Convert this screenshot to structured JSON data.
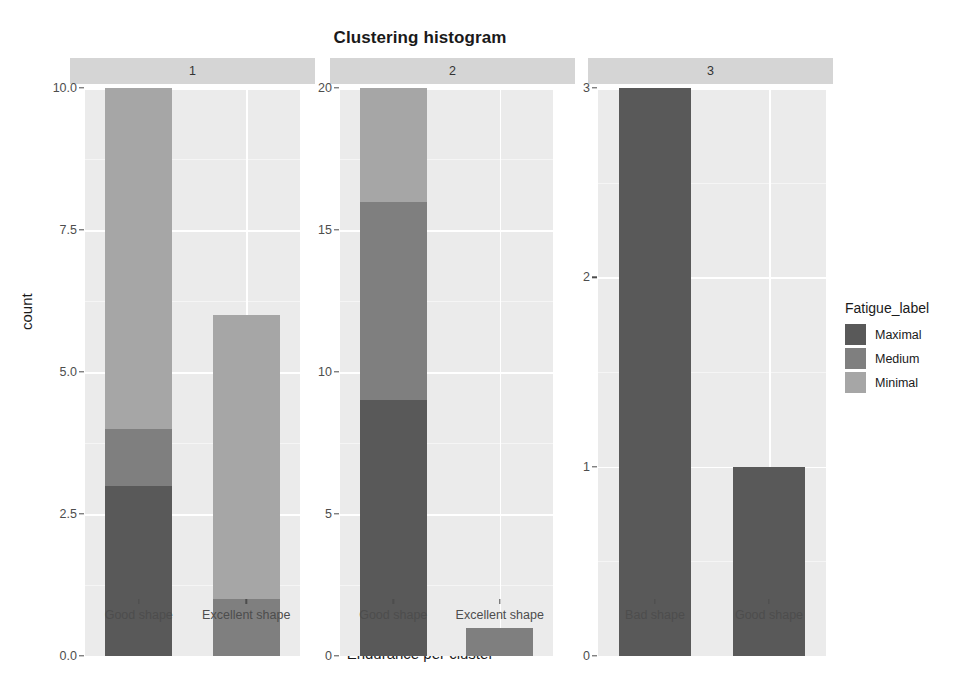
{
  "chart_data": {
    "type": "bar",
    "subtype": "stacked-bar-faceted",
    "title": "Clustering histogram",
    "xlabel": "Endurance per cluster",
    "ylabel": "count",
    "grid": true,
    "legend_position": "right",
    "legend_title": "Fatigue_label",
    "series": [
      {
        "name": "Maximal",
        "color": "#595959"
      },
      {
        "name": "Medium",
        "color": "#7f7f7f"
      },
      {
        "name": "Minimal",
        "color": "#a6a6a6"
      }
    ],
    "facet_variable": "cluster",
    "facets": [
      {
        "label": "1",
        "ylim": [
          0,
          10
        ],
        "yticks": [
          "0.0",
          "2.5",
          "5.0",
          "7.5",
          "10.0"
        ],
        "ytick_values": [
          0,
          2.5,
          5,
          7.5,
          10
        ],
        "categories": [
          "Good shape",
          "Excellent shape"
        ],
        "bars": [
          {
            "category": "Good shape",
            "total": 10,
            "segments": [
              {
                "name": "Maximal",
                "value": 3
              },
              {
                "name": "Medium",
                "value": 1
              },
              {
                "name": "Minimal",
                "value": 6
              }
            ]
          },
          {
            "category": "Excellent shape",
            "total": 6,
            "segments": [
              {
                "name": "Maximal",
                "value": 0
              },
              {
                "name": "Medium",
                "value": 1
              },
              {
                "name": "Minimal",
                "value": 5
              }
            ]
          }
        ]
      },
      {
        "label": "2",
        "ylim": [
          0,
          20
        ],
        "yticks": [
          "0",
          "5",
          "10",
          "15",
          "20"
        ],
        "ytick_values": [
          0,
          5,
          10,
          15,
          20
        ],
        "categories": [
          "Good shape",
          "Excellent shape"
        ],
        "bars": [
          {
            "category": "Good shape",
            "total": 20,
            "segments": [
              {
                "name": "Maximal",
                "value": 9
              },
              {
                "name": "Medium",
                "value": 7
              },
              {
                "name": "Minimal",
                "value": 4
              }
            ]
          },
          {
            "category": "Excellent shape",
            "total": 1,
            "segments": [
              {
                "name": "Maximal",
                "value": 0
              },
              {
                "name": "Medium",
                "value": 1
              },
              {
                "name": "Minimal",
                "value": 0
              }
            ]
          }
        ]
      },
      {
        "label": "3",
        "ylim": [
          0,
          3
        ],
        "yticks": [
          "0",
          "1",
          "2",
          "3"
        ],
        "ytick_values": [
          0,
          1,
          2,
          3
        ],
        "categories": [
          "Bad shape",
          "Good shape"
        ],
        "bars": [
          {
            "category": "Bad shape",
            "total": 3,
            "segments": [
              {
                "name": "Maximal",
                "value": 3
              },
              {
                "name": "Medium",
                "value": 0
              },
              {
                "name": "Minimal",
                "value": 0
              }
            ]
          },
          {
            "category": "Good shape",
            "total": 1,
            "segments": [
              {
                "name": "Maximal",
                "value": 1
              },
              {
                "name": "Medium",
                "value": 0
              },
              {
                "name": "Minimal",
                "value": 0
              }
            ]
          }
        ]
      }
    ]
  },
  "legend": {
    "title": "Fatigue_label",
    "items": [
      {
        "label": "Maximal",
        "color": "#595959"
      },
      {
        "label": "Medium",
        "color": "#7f7f7f"
      },
      {
        "label": "Minimal",
        "color": "#a6a6a6"
      }
    ]
  },
  "theme": {
    "panel_background": "#ebebeb",
    "gridline_major": "#ffffff",
    "gridline_minor": "#f5f5f5",
    "strip_background": "#d5d5d5",
    "text_color": "#1a1a1a",
    "axis_text_color": "#4d4d4d",
    "plot_background": "#ffffff"
  }
}
